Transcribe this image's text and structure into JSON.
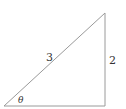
{
  "diagram": {
    "type": "right-triangle",
    "labels": {
      "hypotenuse": "3",
      "opposite": "2",
      "angle": "θ"
    },
    "stroke_color": "#9a9a9a"
  }
}
